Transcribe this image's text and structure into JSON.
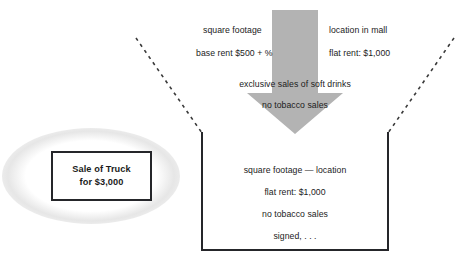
{
  "diagram": {
    "colors": {
      "arrow_gray": "#b3b3b3",
      "line_black": "#25262a",
      "text": "#1b1b1b",
      "background": "#ffffff"
    },
    "left_box": {
      "name": "sale-of-truck-box",
      "line1": "Sale of Truck",
      "line2": "for $3,000"
    },
    "funnel_inputs": {
      "left_column": [
        "square footage",
        "base rent $500 + %"
      ],
      "right_column": [
        "location in mall",
        "flat rent: $1,000"
      ],
      "center_column": [
        "exclusive sales of soft drinks",
        "no tobacco sales"
      ]
    },
    "arrow": {
      "name": "down-arrow",
      "direction": "down",
      "color": "#b3b3b3"
    },
    "container": {
      "name": "agreement-container",
      "shape": "open-top-u",
      "lines": [
        "square footage  —  location",
        "flat rent: $1,000",
        "no tobacco sales",
        "signed, . . ."
      ]
    },
    "dashed_guides": {
      "left": "dashed funnel guide line left",
      "right": "dashed funnel guide line right"
    }
  }
}
